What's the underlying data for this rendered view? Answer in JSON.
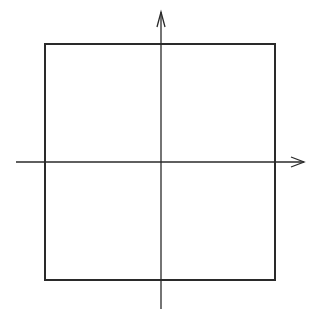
{
  "diagram": {
    "colors": {
      "background": "#ffffff",
      "stroke": "#2a2a2a"
    },
    "square": {
      "x1": 45,
      "y1": 44,
      "x2": 275,
      "y2": 280,
      "stroke_width": 2
    },
    "x_axis": {
      "x1": 16,
      "y1": 162,
      "x2": 304,
      "y2": 162,
      "stroke_width": 1.3,
      "arrow": "right"
    },
    "y_axis": {
      "x1": 161,
      "y1": 309,
      "x2": 161,
      "y2": 12,
      "stroke_width": 1.3,
      "arrow": "up"
    },
    "labels": []
  }
}
